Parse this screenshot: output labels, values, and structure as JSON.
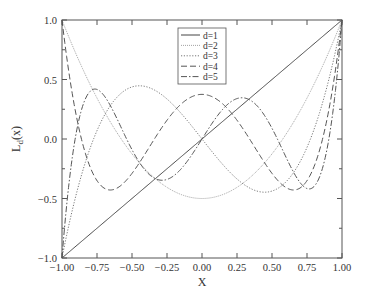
{
  "chart_data": {
    "type": "line",
    "title": "",
    "xlabel": "X",
    "ylabel": "L_d(x)",
    "xlim": [
      -1.0,
      1.0
    ],
    "ylim": [
      -1.0,
      1.0
    ],
    "x_ticks": [
      "-1.00",
      "-0.75",
      "-0.50",
      "-0.25",
      "0.00",
      "0.25",
      "0.50",
      "0.75",
      "1.00"
    ],
    "y_ticks": [
      "-1.0",
      "-0.5",
      "0.0",
      "0.5",
      "1.0"
    ],
    "grid": false,
    "legend_position": "upper center",
    "series": [
      {
        "name": "d=1",
        "style": "solid",
        "formula": "x"
      },
      {
        "name": "d=2",
        "style": "dotted-fine",
        "formula": "(3x^2-1)/2"
      },
      {
        "name": "d=3",
        "style": "dotted",
        "formula": "(5x^3-3x)/2"
      },
      {
        "name": "d=4",
        "style": "dashed",
        "formula": "(35x^4-30x^2+3)/8"
      },
      {
        "name": "d=5",
        "style": "dash-dot",
        "formula": "(63x^5-70x^3+15x)/8"
      }
    ]
  },
  "axes": {
    "xlabel": "X",
    "ylabel_main": "L",
    "ylabel_sub": "d",
    "ylabel_tail": "(x)"
  },
  "legend": {
    "entries": [
      "d=1",
      "d=2",
      "d=3",
      "d=4",
      "d=5"
    ]
  }
}
